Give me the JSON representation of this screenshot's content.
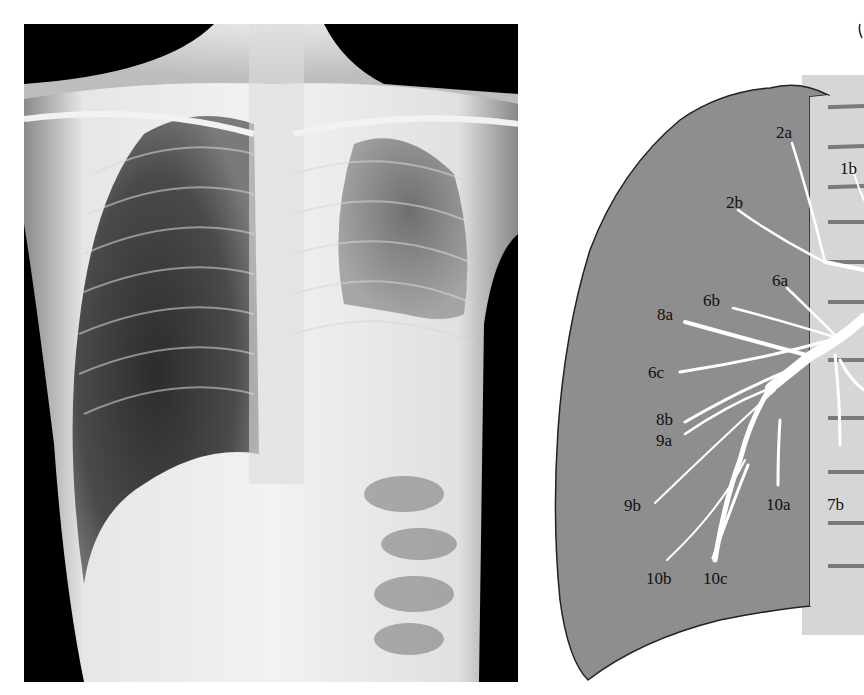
{
  "figure": {
    "left_panel": {
      "type": "chest-radiograph",
      "view": "PA chest X-ray"
    },
    "right_panel": {
      "type": "bronchial-segment-diagram",
      "colors": {
        "lung_fill": "#8e8e8e",
        "lung_outline": "#222222",
        "spine_fill": "#d6d6d6",
        "bronchi": "#ffffff",
        "label_text": "#111111"
      },
      "labels": [
        {
          "id": "2a",
          "text": "2a"
        },
        {
          "id": "1b",
          "text": "1b"
        },
        {
          "id": "2b",
          "text": "2b"
        },
        {
          "id": "6a",
          "text": "6a"
        },
        {
          "id": "6b",
          "text": "6b"
        },
        {
          "id": "8a",
          "text": "8a"
        },
        {
          "id": "6c",
          "text": "6c"
        },
        {
          "id": "8b",
          "text": "8b"
        },
        {
          "id": "9a",
          "text": "9a"
        },
        {
          "id": "9b",
          "text": "9b"
        },
        {
          "id": "10a",
          "text": "10a"
        },
        {
          "id": "7b",
          "text": "7b"
        },
        {
          "id": "10b",
          "text": "10b"
        },
        {
          "id": "10c",
          "text": "10c"
        }
      ]
    }
  }
}
